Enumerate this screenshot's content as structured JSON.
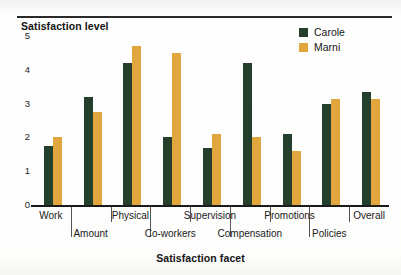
{
  "chart_data": {
    "type": "bar",
    "title": "",
    "ylabel": "Satisfaction level",
    "xlabel": "Satisfaction facet",
    "ylim": [
      0,
      5
    ],
    "yticks": [
      "0",
      "1",
      "2",
      "3",
      "4",
      "5"
    ],
    "grid": false,
    "legend_position": "top-right",
    "categories": [
      "Work",
      "Amount",
      "Physical",
      "Co-workers",
      "Supervision",
      "Compensation",
      "Promotions",
      "Policies",
      "Overall"
    ],
    "series": [
      {
        "name": "Carole",
        "color": "#24402c",
        "values": [
          1.75,
          3.2,
          4.2,
          2.0,
          1.7,
          4.2,
          2.1,
          3.0,
          3.35
        ]
      },
      {
        "name": "Marni",
        "color": "#e2a63f",
        "values": [
          2.0,
          2.75,
          4.7,
          4.5,
          2.1,
          2.0,
          1.6,
          3.15,
          3.15
        ]
      }
    ]
  },
  "legend": {
    "items": [
      {
        "label": "Carole",
        "color": "#24402c"
      },
      {
        "label": "Marni",
        "color": "#e2a63f"
      }
    ]
  }
}
